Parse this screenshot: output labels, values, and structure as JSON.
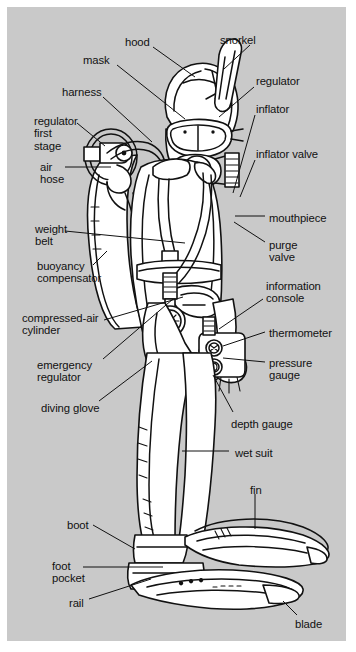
{
  "figure": {
    "background_color": "#c9c9c9",
    "page_color": "#ffffff",
    "ink_color": "#111111",
    "suit_fill": "#ffffff",
    "width": 356,
    "height": 652
  },
  "labels": [
    {
      "id": "hood",
      "text": "hood",
      "x": 118,
      "y": 29,
      "align": "left"
    },
    {
      "id": "snorkel",
      "text": "snorkel",
      "x": 213,
      "y": 27,
      "align": "left"
    },
    {
      "id": "mask",
      "text": "mask",
      "x": 76,
      "y": 47,
      "align": "left"
    },
    {
      "id": "regulator",
      "text": "regulator",
      "x": 249,
      "y": 68,
      "align": "left"
    },
    {
      "id": "harness",
      "text": "harness",
      "x": 55,
      "y": 79,
      "align": "left"
    },
    {
      "id": "inflator",
      "text": "inflator",
      "x": 249,
      "y": 96,
      "align": "left"
    },
    {
      "id": "regulator-first-stage",
      "text": "regulator\nfirst\nstage",
      "x": 27,
      "y": 108,
      "align": "left"
    },
    {
      "id": "inflator-valve",
      "text": "inflator valve",
      "x": 249,
      "y": 141,
      "align": "left"
    },
    {
      "id": "air-hose",
      "text": "air\nhose",
      "x": 33,
      "y": 154,
      "align": "left"
    },
    {
      "id": "mouthpiece",
      "text": "mouthpiece",
      "x": 262,
      "y": 205,
      "align": "left"
    },
    {
      "id": "weight-belt",
      "text": "weight\nbelt",
      "x": 28,
      "y": 216,
      "align": "left"
    },
    {
      "id": "purge-valve",
      "text": "purge\nvalve",
      "x": 262,
      "y": 232,
      "align": "left"
    },
    {
      "id": "buoyancy-compensator",
      "text": "buoyancy\ncompensator",
      "x": 30,
      "y": 253,
      "align": "left"
    },
    {
      "id": "information-console",
      "text": "information\nconsole",
      "x": 259,
      "y": 273,
      "align": "left"
    },
    {
      "id": "compressed-air-cylinder",
      "text": "compressed-air\ncylinder",
      "x": 15,
      "y": 305,
      "align": "left"
    },
    {
      "id": "thermometer",
      "text": "thermometer",
      "x": 262,
      "y": 320,
      "align": "left"
    },
    {
      "id": "emergency-regulator",
      "text": "emergency\nregulator",
      "x": 30,
      "y": 352,
      "align": "left"
    },
    {
      "id": "pressure-gauge",
      "text": "pressure\ngauge",
      "x": 262,
      "y": 350,
      "align": "left"
    },
    {
      "id": "diving-glove",
      "text": "diving glove",
      "x": 34,
      "y": 395,
      "align": "left"
    },
    {
      "id": "depth-gauge",
      "text": "depth gauge",
      "x": 224,
      "y": 411,
      "align": "left"
    },
    {
      "id": "wet-suit",
      "text": "wet suit",
      "x": 228,
      "y": 440,
      "align": "left"
    },
    {
      "id": "fin",
      "text": "fin",
      "x": 243,
      "y": 477,
      "align": "left"
    },
    {
      "id": "boot",
      "text": "boot",
      "x": 60,
      "y": 512,
      "align": "left"
    },
    {
      "id": "foot-pocket",
      "text": "foot\npocket",
      "x": 45,
      "y": 553,
      "align": "left"
    },
    {
      "id": "rail",
      "text": "rail",
      "x": 62,
      "y": 590,
      "align": "left"
    },
    {
      "id": "blade",
      "text": "blade",
      "x": 288,
      "y": 611,
      "align": "left"
    }
  ],
  "leader_lines": [
    {
      "id": "leader-hood",
      "points": "146,40 188,70"
    },
    {
      "id": "leader-snorkel",
      "points": "243,38 217,62"
    },
    {
      "id": "leader-mask",
      "points": "110,58 178,112"
    },
    {
      "id": "leader-regulator",
      "points": "247,80 212,110"
    },
    {
      "id": "leader-harness",
      "points": "96,90 145,135"
    },
    {
      "id": "leader-inflator",
      "points": "248,108 226,186"
    },
    {
      "id": "leader-regulator-first-stage",
      "points": "70,116 98,139"
    },
    {
      "id": "leader-inflator-valve",
      "points": "248,153 233,190"
    },
    {
      "id": "leader-air-hose",
      "points": "58,160 104,160"
    },
    {
      "id": "leader-mouthpiece",
      "points": "258,209 228,209"
    },
    {
      "id": "leader-weight-belt",
      "points": "58,224 178,236"
    },
    {
      "id": "leader-purge-valve",
      "points": "258,235 227,215"
    },
    {
      "id": "leader-buoyancy-compensator",
      "points": "86,258 100,244"
    },
    {
      "id": "leader-information-console",
      "points": "256,292 212,322"
    },
    {
      "id": "leader-compressed-air-cylinder",
      "points": "97,313 176,290"
    },
    {
      "id": "leader-thermometer",
      "points": "258,325 216,339"
    },
    {
      "id": "leader-emergency-regulator",
      "points": "96,352 166,292"
    },
    {
      "id": "leader-pressure-gauge",
      "points": "258,355 216,351"
    },
    {
      "id": "leader-diving-glove",
      "points": "92,394 145,354"
    },
    {
      "id": "leader-depth-gauge",
      "points": "226,405 206,368"
    },
    {
      "id": "leader-wet-suit",
      "points": "222,444 175,444"
    },
    {
      "id": "leader-fin",
      "points": "248,487 248,522"
    },
    {
      "id": "leader-boot",
      "points": "86,518 128,542"
    },
    {
      "id": "leader-foot-pocket",
      "points": "76,560 156,560"
    },
    {
      "id": "leader-rail",
      "points": "82,592 144,572"
    },
    {
      "id": "leader-blade",
      "points": "290,608 276,594"
    }
  ],
  "icons": {
    "diver_figure": "scuba-diver-illustration",
    "tank": "compressed-air-cylinder-icon",
    "gauge": "pressure-gauge-dial-icon",
    "console": "information-console-icon",
    "fin": "swim-fin-icon"
  }
}
